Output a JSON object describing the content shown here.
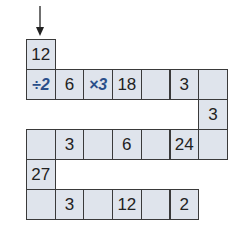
{
  "puzzle": {
    "start_arrow": "arrow-down-icon",
    "cell_fill": "#dfe4ec",
    "operator_color": "#2a4f8a",
    "cells": [
      {
        "row": 0,
        "col": 0,
        "value": "12",
        "type": "number"
      },
      {
        "row": 1,
        "col": 0,
        "value": "÷2",
        "type": "operator"
      },
      {
        "row": 1,
        "col": 1,
        "value": "6",
        "type": "number"
      },
      {
        "row": 1,
        "col": 2,
        "value": "×3",
        "type": "operator"
      },
      {
        "row": 1,
        "col": 3,
        "value": "18",
        "type": "number"
      },
      {
        "row": 1,
        "col": 4,
        "value": "",
        "type": "blank"
      },
      {
        "row": 1,
        "col": 5,
        "value": "3",
        "type": "number"
      },
      {
        "row": 1,
        "col": 6,
        "value": "",
        "type": "blank"
      },
      {
        "row": 2,
        "col": 6,
        "value": "3",
        "type": "number"
      },
      {
        "row": 3,
        "col": 0,
        "value": "",
        "type": "blank"
      },
      {
        "row": 3,
        "col": 1,
        "value": "3",
        "type": "number"
      },
      {
        "row": 3,
        "col": 2,
        "value": "",
        "type": "blank"
      },
      {
        "row": 3,
        "col": 3,
        "value": "6",
        "type": "number"
      },
      {
        "row": 3,
        "col": 4,
        "value": "",
        "type": "blank"
      },
      {
        "row": 3,
        "col": 5,
        "value": "24",
        "type": "number"
      },
      {
        "row": 3,
        "col": 6,
        "value": "",
        "type": "blank"
      },
      {
        "row": 4,
        "col": 0,
        "value": "27",
        "type": "number"
      },
      {
        "row": 5,
        "col": 0,
        "value": "",
        "type": "blank"
      },
      {
        "row": 5,
        "col": 1,
        "value": "3",
        "type": "number"
      },
      {
        "row": 5,
        "col": 2,
        "value": "",
        "type": "blank"
      },
      {
        "row": 5,
        "col": 3,
        "value": "12",
        "type": "number"
      },
      {
        "row": 5,
        "col": 4,
        "value": "",
        "type": "blank"
      },
      {
        "row": 5,
        "col": 5,
        "value": "2",
        "type": "number"
      }
    ]
  }
}
